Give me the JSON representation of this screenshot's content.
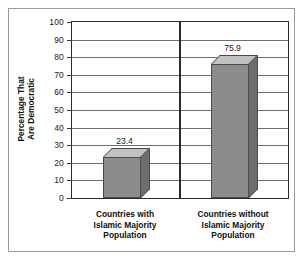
{
  "chart_data": {
    "type": "bar",
    "title": "",
    "xlabel": "",
    "ylabel_line1": "Percentage That",
    "ylabel_line2": "Are Democratic",
    "categories": [
      "Countries with\nIslamic Majority\nPopulation",
      "Countries without\nIslamic Majority\nPopulation"
    ],
    "values": [
      23.4,
      75.9
    ],
    "value_labels": [
      "23.4",
      "75.9"
    ],
    "ylim": [
      0,
      100
    ],
    "ytick_labels": [
      "100",
      "90",
      "80",
      "70",
      "60",
      "50",
      "40",
      "30",
      "20",
      "10",
      "0"
    ],
    "ytick_values": [
      100,
      90,
      80,
      70,
      60,
      50,
      40,
      30,
      20,
      10,
      0
    ],
    "grid": true,
    "legend": false,
    "style_3d": true,
    "colors": {
      "bar_front": "#8c8c8c",
      "bar_top": "#c2c2c2",
      "bar_side": "#6e6e6e",
      "bar_edge": "#4a4a4a",
      "gridline": "#6e6e6e",
      "axis": "#2b2b2b",
      "frame": "#9a9a9a",
      "background": "#ffffff",
      "text": "#111111"
    }
  }
}
